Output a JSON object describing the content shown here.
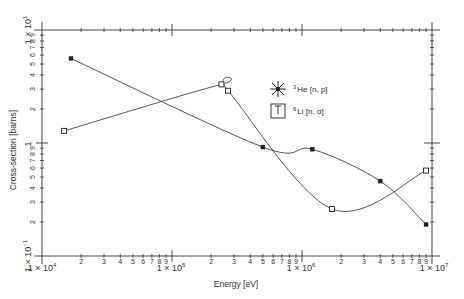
{
  "chart_data": {
    "type": "line",
    "title": "",
    "xlabel": "Energy  [eV]",
    "ylabel": "Cross-section [barns]",
    "xscale": "log",
    "yscale": "log",
    "xlim": [
      10000,
      10000000
    ],
    "ylim": [
      0.1,
      10
    ],
    "grid": false,
    "legend_position": "upper center (inside plot)",
    "x_decade_labels": [
      "1 × 10⁴",
      "1 × 10⁵",
      "1 × 10⁶",
      "1 × 10⁷"
    ],
    "y_decade_labels": [
      "1 × 10⁻¹",
      "1",
      "1 × 10¹"
    ],
    "minor_tick_labels": [
      "2",
      "3",
      "4",
      "5",
      "6",
      "7",
      "8",
      "9"
    ],
    "series": [
      {
        "name": "³He [n, p]",
        "marker": "filled-square",
        "x": [
          16700,
          500000,
          1200000,
          4000000,
          9000000
        ],
        "y": [
          5.6,
          0.92,
          0.88,
          0.46,
          0.19
        ]
      },
      {
        "name": "⁶Li [n, α]",
        "marker": "open-square",
        "x": [
          14800,
          240000,
          270000,
          1700000,
          9000000
        ],
        "y": [
          1.28,
          3.3,
          2.9,
          0.26,
          0.57
        ]
      }
    ]
  },
  "legend": {
    "he": {
      "label_sup": "3",
      "label_main": "He [n, p]"
    },
    "li": {
      "label_sup": "6",
      "label_main": "Li [n, α]"
    }
  },
  "axes": {
    "x_title": "Energy  [eV]",
    "y_title": "Cross-section [barns]",
    "x10e4": "1 × 10",
    "x10e4_exp": "4",
    "x10e5": "1 × 10",
    "x10e5_exp": "5",
    "x10e6": "1 × 10",
    "x10e6_exp": "6",
    "x10e7": "1 × 10",
    "x10e7_exp": "7",
    "y10e1": "1 × 10",
    "y10e1_exp": "1",
    "y10e0": "1",
    "y10em1": "1 × 10",
    "y10em1_exp": "−1"
  }
}
